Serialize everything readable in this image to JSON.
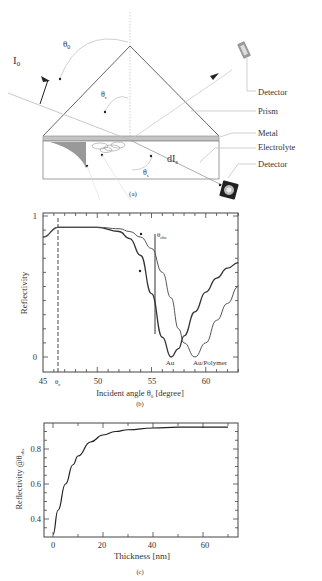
{
  "panel_a": {
    "caption": "(a)",
    "labels": {
      "incident_intensity": "I",
      "incident_intensity_sub": "0",
      "theta0": "θ",
      "theta0_sub": "0",
      "thetac": "θ",
      "thetac_sub": "c",
      "thetas": "θ",
      "thetas_sub": "s",
      "scattered": "dI",
      "scattered_sub": "s",
      "detector_top": "Detector",
      "prism": "Prism",
      "metal": "Metal",
      "electrolyte": "Electrolyte",
      "detector_bottom": "Detector"
    },
    "colors": {
      "line": "#555555",
      "metal": "#bbbbbb",
      "guide": "#cccccc"
    }
  },
  "panel_b": {
    "caption": "(b)",
    "ylabel": "Reflectivity",
    "xlabel": "Incident angle  θ",
    "xlabel_sub": "0",
    "xlabel_unit": " [degree]",
    "ytick_labels": [
      "1",
      "0"
    ],
    "xtick_labels": [
      "45",
      "50",
      "55",
      "60"
    ],
    "thetac_label": "θ",
    "thetac_sub": "c",
    "thetaobs_label": "θ",
    "thetaobs_sub": "obs",
    "curve_labels": [
      "Au",
      "Au/Polymer"
    ]
  },
  "panel_c": {
    "caption": "(c)",
    "ylabel": "Reflectivity @θ",
    "ylabel_sub": "obs",
    "xlabel": "Thickness [nm]",
    "ytick_labels": [
      "0.4",
      "0.6",
      "0.8"
    ],
    "xtick_labels": [
      "0",
      "20",
      "40",
      "60"
    ]
  },
  "chart_data": [
    {
      "type": "line",
      "title": "(b) SPR reflectivity curves",
      "xlabel": "Incident angle θ0 [degree]",
      "ylabel": "Reflectivity",
      "xlim": [
        45,
        63
      ],
      "ylim": [
        -0.1,
        1.02
      ],
      "grid": false,
      "annotations": [
        "θc ≈ 46.4 (dashed)",
        "θobs ≈ 55.3 (vertical line)",
        "Au",
        "Au/Polymer"
      ],
      "x": [
        45,
        46.4,
        48,
        50,
        52,
        53,
        54,
        55,
        56,
        56.8,
        57.5,
        58,
        59,
        60,
        61,
        62,
        63
      ],
      "series": [
        {
          "name": "Au",
          "values": [
            0.85,
            0.92,
            0.92,
            0.92,
            0.89,
            0.84,
            0.72,
            0.45,
            0.14,
            0.0,
            0.06,
            0.15,
            0.32,
            0.46,
            0.56,
            0.63,
            0.67
          ]
        },
        {
          "name": "Au/Polymer",
          "values": [
            0.85,
            0.92,
            0.92,
            0.92,
            0.91,
            0.89,
            0.85,
            0.77,
            0.6,
            0.42,
            0.2,
            0.1,
            0.0,
            0.1,
            0.26,
            0.38,
            0.5
          ]
        }
      ]
    },
    {
      "type": "line",
      "title": "(c) Reflectivity at θobs vs thickness",
      "xlabel": "Thickness [nm]",
      "ylabel": "Reflectivity @θobs",
      "xlim": [
        -3,
        72
      ],
      "ylim": [
        0.3,
        0.95
      ],
      "grid": false,
      "x": [
        0,
        2,
        5,
        8,
        10,
        15,
        20,
        25,
        30,
        40,
        50,
        60,
        70
      ],
      "series": [
        {
          "name": "Reflectivity",
          "values": [
            0.31,
            0.45,
            0.6,
            0.71,
            0.76,
            0.84,
            0.88,
            0.9,
            0.91,
            0.92,
            0.925,
            0.925,
            0.925
          ]
        }
      ]
    }
  ]
}
